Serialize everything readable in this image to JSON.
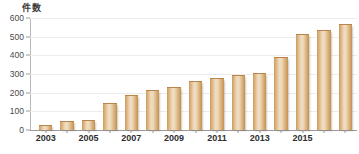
{
  "chart_data": {
    "type": "bar",
    "title": "",
    "subtitle": "",
    "xlabel": "",
    "ylabel": "件数",
    "ylim": [
      0,
      600
    ],
    "yticks": [
      0,
      100,
      200,
      300,
      400,
      500,
      600
    ],
    "ytick_labels": [
      "0",
      "100",
      "200",
      "300",
      "400",
      "500",
      "600"
    ],
    "grid": true,
    "legend": null,
    "categories": [
      "2003",
      "2004",
      "2005",
      "2006",
      "2007",
      "2008",
      "2009",
      "2010",
      "2011",
      "2012",
      "2013",
      "2014",
      "2015",
      "2016",
      "2017"
    ],
    "xtick_labels": [
      "2003",
      "2005",
      "2007",
      "2009",
      "2011",
      "2013",
      "2015"
    ],
    "values": [
      20,
      45,
      48,
      140,
      180,
      210,
      225,
      255,
      275,
      290,
      300,
      385,
      510,
      530,
      560
    ],
    "series": [
      {
        "name": "件数",
        "values": [
          20,
          45,
          48,
          140,
          180,
          210,
          225,
          255,
          275,
          290,
          300,
          385,
          510,
          530,
          560
        ]
      }
    ],
    "colors": {
      "bar_edge": "#c4914f",
      "bar_light": "#efdcc0",
      "bar_mid": "#d9b07a",
      "grid": "#ececec",
      "axis": "#9a9a9a",
      "text": "#2e2e2e"
    }
  }
}
